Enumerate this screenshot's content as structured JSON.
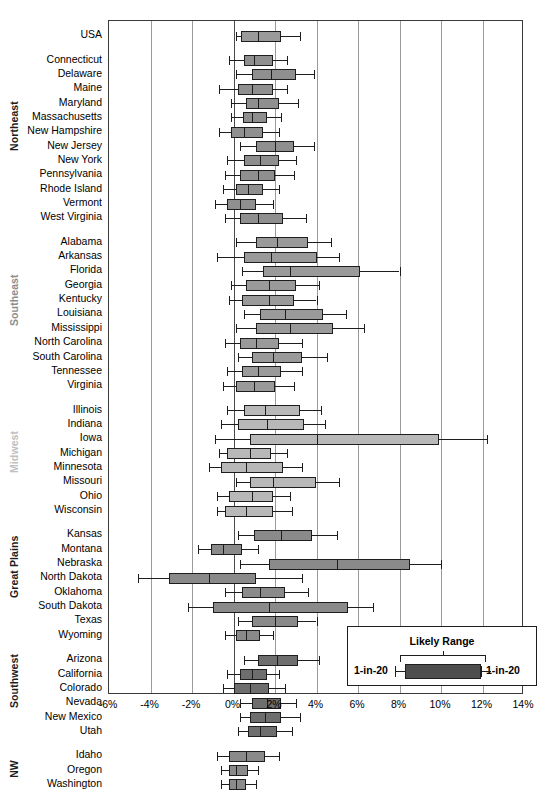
{
  "chart_data": {
    "type": "box",
    "title": "",
    "xlabel": "",
    "ylabel": "",
    "xlim": [
      -6,
      14
    ],
    "grid": true,
    "xticks": [
      "-6%",
      "-4%",
      "-2%",
      "0%",
      "2%",
      "4%",
      "6%",
      "8%",
      "10%",
      "12%",
      "14%"
    ],
    "xtick_values": [
      -6,
      -4,
      -2,
      0,
      2,
      4,
      6,
      8,
      10,
      12,
      14
    ],
    "legend": {
      "title": "Likely Range",
      "left_label": "1-in-20",
      "right_label": "1-in-20",
      "position": "bottom-right"
    },
    "box_note": "Values are percent change. Box = likely range (25th-75th), whiskers = 1-in-20 bounds, line = median.",
    "colors": {
      "box_dark": "#808080",
      "box_medium": "#9a9a9a",
      "box_light": "#b8b8b8",
      "box_darker": "#6a6a6a",
      "outline": "#1d1d1d",
      "gridline": "#9a9a9a",
      "axis": "#3a3a3a",
      "region_northeast": "#1d1d1d",
      "region_southeast": "#8c8c8c",
      "region_midwest": "#c0c0c0",
      "region_great_plains": "#1d1d1d",
      "region_southwest": "#1d1d1d",
      "region_nw": "#1d1d1d"
    },
    "groups": [
      {
        "name": "USA",
        "label_color": "#1d1d1d",
        "fill": "#9a9a9a",
        "rows": [
          {
            "label": "USA",
            "low": 0.1,
            "q1": 0.35,
            "median": 1.2,
            "q3": 2.3,
            "high": 3.2
          }
        ]
      },
      {
        "name": "Northeast",
        "label_color": "#1d1d1d",
        "fill": "#8f8f8f",
        "rows": [
          {
            "label": "Connecticut",
            "low": -0.2,
            "q1": 0.5,
            "median": 1.0,
            "q3": 1.9,
            "high": 2.6
          },
          {
            "label": "Delaware",
            "low": 0.1,
            "q1": 0.9,
            "median": 1.8,
            "q3": 3.0,
            "high": 3.9
          },
          {
            "label": "Maine",
            "low": -0.7,
            "q1": 0.2,
            "median": 0.9,
            "q3": 1.9,
            "high": 2.6
          },
          {
            "label": "Maryland",
            "low": -0.1,
            "q1": 0.6,
            "median": 1.2,
            "q3": 2.2,
            "high": 3.1
          },
          {
            "label": "Massachusetts",
            "low": -0.1,
            "q1": 0.45,
            "median": 0.9,
            "q3": 1.6,
            "high": 2.3
          },
          {
            "label": "New Hampshire",
            "low": -0.7,
            "q1": -0.1,
            "median": 0.5,
            "q3": 1.4,
            "high": 2.2
          },
          {
            "label": "New Jersey",
            "low": 0.3,
            "q1": 1.1,
            "median": 2.0,
            "q3": 2.9,
            "high": 3.9
          },
          {
            "label": "New York",
            "low": -0.3,
            "q1": 0.5,
            "median": 1.3,
            "q3": 2.2,
            "high": 3.0
          },
          {
            "label": "Pennsylvania",
            "low": -0.4,
            "q1": 0.3,
            "median": 1.2,
            "q3": 2.0,
            "high": 2.9
          },
          {
            "label": "Rhode Island",
            "low": -0.5,
            "q1": 0.1,
            "median": 0.7,
            "q3": 1.4,
            "high": 2.2
          },
          {
            "label": "Vermont",
            "low": -0.9,
            "q1": -0.3,
            "median": 0.3,
            "q3": 1.1,
            "high": 1.9
          },
          {
            "label": "West Virginia",
            "low": -0.4,
            "q1": 0.3,
            "median": 1.2,
            "q3": 2.4,
            "high": 3.5
          }
        ]
      },
      {
        "name": "Southeast",
        "label_color": "#8c8c8c",
        "fill": "#9a9a9a",
        "rows": [
          {
            "label": "Alabama",
            "low": 0.1,
            "q1": 1.1,
            "median": 2.1,
            "q3": 3.6,
            "high": 4.7
          },
          {
            "label": "Arkansas",
            "low": -0.8,
            "q1": 0.5,
            "median": 1.8,
            "q3": 4.0,
            "high": 5.1
          },
          {
            "label": "Florida",
            "low": 0.4,
            "q1": 1.4,
            "median": 2.7,
            "q3": 6.1,
            "high": 8.0
          },
          {
            "label": "Georgia",
            "low": -0.1,
            "q1": 0.6,
            "median": 1.7,
            "q3": 3.0,
            "high": 4.1
          },
          {
            "label": "Kentucky",
            "low": -0.2,
            "q1": 0.4,
            "median": 1.7,
            "q3": 2.9,
            "high": 4.0
          },
          {
            "label": "Louisiana",
            "low": 0.5,
            "q1": 1.3,
            "median": 2.5,
            "q3": 4.3,
            "high": 5.4
          },
          {
            "label": "Mississippi",
            "low": 0.1,
            "q1": 1.1,
            "median": 2.7,
            "q3": 4.8,
            "high": 6.3
          },
          {
            "label": "North Carolina",
            "low": -0.4,
            "q1": 0.3,
            "median": 1.1,
            "q3": 2.2,
            "high": 3.3
          },
          {
            "label": "South Carolina",
            "low": 0.2,
            "q1": 0.9,
            "median": 1.9,
            "q3": 3.3,
            "high": 4.5
          },
          {
            "label": "Tennessee",
            "low": -0.3,
            "q1": 0.4,
            "median": 1.2,
            "q3": 2.3,
            "high": 3.3
          },
          {
            "label": "Virginia",
            "low": -0.5,
            "q1": 0.1,
            "median": 1.0,
            "q3": 2.0,
            "high": 2.9
          }
        ]
      },
      {
        "name": "Midwest",
        "label_color": "#c0c0c0",
        "fill": "#b8b8b8",
        "rows": [
          {
            "label": "Illinois",
            "low": -0.3,
            "q1": 0.5,
            "median": 1.5,
            "q3": 3.2,
            "high": 4.2
          },
          {
            "label": "Indiana",
            "low": -0.6,
            "q1": 0.2,
            "median": 1.6,
            "q3": 3.4,
            "high": 4.4
          },
          {
            "label": "Iowa",
            "low": -0.9,
            "q1": 0.8,
            "median": 4.0,
            "q3": 9.9,
            "high": 12.2
          },
          {
            "label": "Michigan",
            "low": -0.7,
            "q1": -0.3,
            "median": 0.8,
            "q3": 1.8,
            "high": 2.6
          },
          {
            "label": "Minnesota",
            "low": -1.2,
            "q1": -0.6,
            "median": 0.6,
            "q3": 2.4,
            "high": 3.3
          },
          {
            "label": "Missouri",
            "low": 0.1,
            "q1": 0.8,
            "median": 1.9,
            "q3": 4.0,
            "high": 5.1
          },
          {
            "label": "Ohio",
            "low": -0.8,
            "q1": -0.2,
            "median": 0.9,
            "q3": 1.9,
            "high": 2.7
          },
          {
            "label": "Wisconsin",
            "low": -0.8,
            "q1": -0.4,
            "median": 0.6,
            "q3": 1.9,
            "high": 2.8
          }
        ]
      },
      {
        "name": "Great Plains",
        "label_color": "#1d1d1d",
        "fill": "#8a8a8a",
        "rows": [
          {
            "label": "Kansas",
            "low": 0.2,
            "q1": 1.0,
            "median": 2.3,
            "q3": 3.8,
            "high": 5.0
          },
          {
            "label": "Montana",
            "low": -1.7,
            "q1": -1.1,
            "median": -0.5,
            "q3": 0.4,
            "high": 1.2
          },
          {
            "label": "Nebraska",
            "low": 0.3,
            "q1": 1.7,
            "median": 5.0,
            "q3": 8.5,
            "high": 10.0
          },
          {
            "label": "North Dakota",
            "low": -4.6,
            "q1": -3.1,
            "median": -1.2,
            "q3": 1.1,
            "high": 3.3
          },
          {
            "label": "Oklahoma",
            "low": -0.4,
            "q1": 0.4,
            "median": 1.3,
            "q3": 2.5,
            "high": 3.6
          },
          {
            "label": "South Dakota",
            "low": -2.2,
            "q1": -1.0,
            "median": 1.7,
            "q3": 5.5,
            "high": 6.7
          },
          {
            "label": "Texas",
            "low": 0.2,
            "q1": 0.9,
            "median": 2.0,
            "q3": 3.1,
            "high": 4.0
          },
          {
            "label": "Wyoming",
            "low": -0.4,
            "q1": 0.1,
            "median": 0.6,
            "q3": 1.3,
            "high": 1.9
          }
        ]
      },
      {
        "name": "Southwest",
        "label_color": "#1d1d1d",
        "fill": "#6e6e6e",
        "rows": [
          {
            "label": "Arizona",
            "low": 0.5,
            "q1": 1.2,
            "median": 2.1,
            "q3": 3.1,
            "high": 4.1
          },
          {
            "label": "California",
            "low": -0.3,
            "q1": 0.3,
            "median": 0.9,
            "q3": 1.6,
            "high": 2.2
          },
          {
            "label": "Colorado",
            "low": -0.5,
            "q1": 0.0,
            "median": 0.8,
            "q3": 1.7,
            "high": 2.5
          },
          {
            "label": "Nevada",
            "low": 0.3,
            "q1": 0.9,
            "median": 1.6,
            "q3": 2.3,
            "high": 3.0
          },
          {
            "label": "New Mexico",
            "low": 0.3,
            "q1": 0.8,
            "median": 1.5,
            "q3": 2.3,
            "high": 3.2
          },
          {
            "label": "Utah",
            "low": 0.2,
            "q1": 0.7,
            "median": 1.3,
            "q3": 2.1,
            "high": 2.8
          }
        ]
      },
      {
        "name": "NW",
        "label_color": "#1d1d1d",
        "fill": "#8a8a8a",
        "rows": [
          {
            "label": "Idaho",
            "low": -0.8,
            "q1": -0.2,
            "median": 0.6,
            "q3": 1.5,
            "high": 2.2
          },
          {
            "label": "Oregon",
            "low": -0.6,
            "q1": -0.2,
            "median": 0.1,
            "q3": 0.7,
            "high": 1.2
          },
          {
            "label": "Washington",
            "low": -0.6,
            "q1": -0.2,
            "median": 0.1,
            "q3": 0.6,
            "high": 1.1
          }
        ]
      }
    ]
  }
}
